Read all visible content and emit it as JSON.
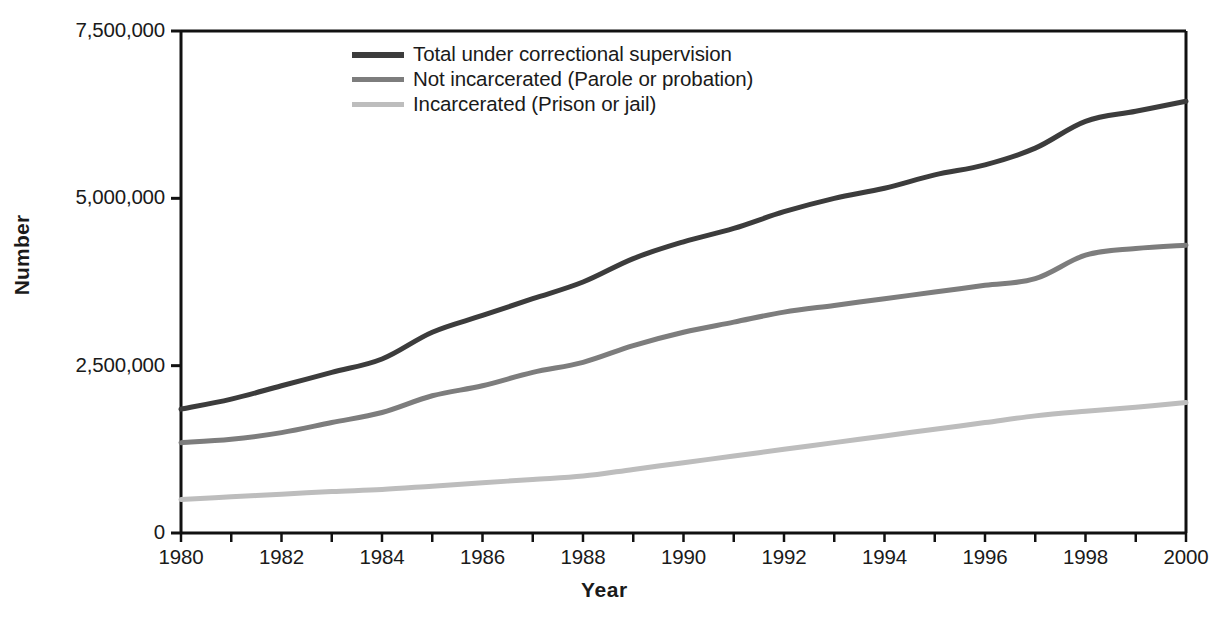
{
  "chart_data": {
    "type": "line",
    "title": "",
    "xlabel": "Year",
    "ylabel": "Number",
    "xlim": [
      1980,
      2000
    ],
    "ylim": [
      0,
      7500000
    ],
    "grid": false,
    "legend_position": "top-center-left",
    "x": [
      1980,
      1981,
      1982,
      1983,
      1984,
      1985,
      1986,
      1987,
      1988,
      1989,
      1990,
      1991,
      1992,
      1993,
      1994,
      1995,
      1996,
      1997,
      1998,
      1999,
      2000
    ],
    "xtick_labels": [
      "1980",
      "1982",
      "1984",
      "1986",
      "1988",
      "1990",
      "1992",
      "1994",
      "1996",
      "1998",
      "2000"
    ],
    "ytick_labels": [
      "0",
      "2,500,000",
      "5,000,000",
      "7,500,000"
    ],
    "ytick_values": [
      0,
      2500000,
      5000000,
      7500000
    ],
    "series": [
      {
        "name": "Total under correctional supervision",
        "color": "#3c3c3c",
        "width": 5,
        "values": [
          1850000,
          2000000,
          2200000,
          2400000,
          2600000,
          3000000,
          3250000,
          3500000,
          3750000,
          4100000,
          4350000,
          4550000,
          4800000,
          5000000,
          5150000,
          5350000,
          5500000,
          5750000,
          6150000,
          6300000,
          6450000
        ]
      },
      {
        "name": "Not incarcerated (Parole or probation)",
        "color": "#7d7d7d",
        "width": 5,
        "values": [
          1350000,
          1400000,
          1500000,
          1650000,
          1800000,
          2050000,
          2200000,
          2400000,
          2550000,
          2800000,
          3000000,
          3150000,
          3300000,
          3400000,
          3500000,
          3600000,
          3700000,
          3800000,
          4150000,
          4250000,
          4300000
        ]
      },
      {
        "name": "Incarcerated (Prison or jail)",
        "color": "#bdbdbd",
        "width": 5,
        "values": [
          500000,
          540000,
          580000,
          620000,
          650000,
          700000,
          750000,
          800000,
          850000,
          950000,
          1050000,
          1150000,
          1250000,
          1350000,
          1450000,
          1550000,
          1650000,
          1750000,
          1820000,
          1880000,
          1950000
        ]
      }
    ]
  },
  "axes": {
    "y_axis_title": "Number",
    "x_axis_title": "Year"
  },
  "legend": {
    "items": [
      {
        "label": "Total under correctional supervision",
        "color": "#3c3c3c"
      },
      {
        "label": "Not incarcerated (Parole or probation)",
        "color": "#7d7d7d"
      },
      {
        "label": "Incarcerated (Prison or jail)",
        "color": "#bdbdbd"
      }
    ]
  },
  "colors": {
    "total": "#3c3c3c",
    "not_incarcerated": "#7d7d7d",
    "incarcerated": "#bdbdbd",
    "axis": "#111111",
    "background": "#ffffff"
  }
}
